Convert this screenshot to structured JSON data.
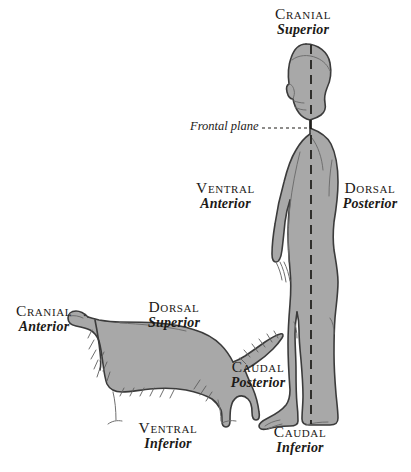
{
  "figure": {
    "background_color": "#ffffff",
    "ink_color": "#1c1a17",
    "silhouette_fill": "#a8a8a8",
    "silhouette_outline": "#3b3b3b"
  },
  "human": {
    "orientation": "standing, left-facing profile",
    "cranial": {
      "primary": "Cranial",
      "secondary": "Superior"
    },
    "ventral": {
      "primary": "Ventral",
      "secondary": "Anterior"
    },
    "dorsal": {
      "primary": "Dorsal",
      "secondary": "Posterior"
    },
    "caudal": {
      "primary": "Caudal",
      "secondary": "Inferior"
    },
    "frontal_plane_label": "Frontal plane"
  },
  "dog": {
    "orientation": "standing quadruped, left-facing profile",
    "cranial": {
      "primary": "Cranial",
      "secondary": "Anterior"
    },
    "dorsal": {
      "primary": "Dorsal",
      "secondary": "Superior"
    },
    "caudal": {
      "primary": "Caudal",
      "secondary": "Posterior"
    },
    "ventral": {
      "primary": "Ventral",
      "secondary": "Inferior"
    }
  }
}
